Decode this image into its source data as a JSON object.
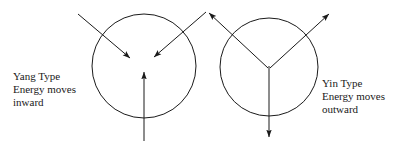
{
  "figure": {
    "background_color": "#ffffff",
    "stroke_color": "#1a1a1a",
    "stroke_width": 1
  },
  "captions": {
    "yang": {
      "name": "yang-caption",
      "line1": "Yang Type",
      "line2": "Energy moves",
      "line3": "inward"
    },
    "yin": {
      "name": "yin-caption",
      "line1": "Yin Type",
      "line2": "Energy moves",
      "line3": "outward"
    }
  },
  "diagram_data": {
    "type": "diagram",
    "description": "Two circles with arrows: left circle has three arrows pointing inward (Yang), right circle has three arrows pointing outward (Yin).",
    "shapes": [
      {
        "name": "yang-circle",
        "kind": "circle",
        "cx": 144,
        "cy": 66,
        "r": 52
      },
      {
        "name": "yin-circle",
        "kind": "circle",
        "cx": 269,
        "cy": 67,
        "r": 49
      }
    ],
    "arrows": [
      {
        "name": "yang-arrow-upper-left",
        "group": "yang",
        "direction": "inward",
        "x1": 78,
        "y1": 14,
        "x2": 130,
        "y2": 58
      },
      {
        "name": "yang-arrow-upper-right",
        "group": "yang",
        "direction": "inward",
        "x1": 206,
        "y1": 12,
        "x2": 154,
        "y2": 57
      },
      {
        "name": "yang-arrow-bottom",
        "group": "yang",
        "direction": "inward",
        "x1": 144,
        "y1": 141,
        "x2": 144,
        "y2": 72
      },
      {
        "name": "yin-arrow-upper-left",
        "group": "yin",
        "direction": "outward",
        "x1": 268,
        "y1": 68,
        "x2": 209,
        "y2": 13
      },
      {
        "name": "yin-arrow-upper-right",
        "group": "yin",
        "direction": "outward",
        "x1": 270,
        "y1": 68,
        "x2": 329,
        "y2": 14
      },
      {
        "name": "yin-arrow-bottom",
        "group": "yin",
        "direction": "outward",
        "x1": 269,
        "y1": 66,
        "x2": 269,
        "y2": 137
      }
    ]
  }
}
